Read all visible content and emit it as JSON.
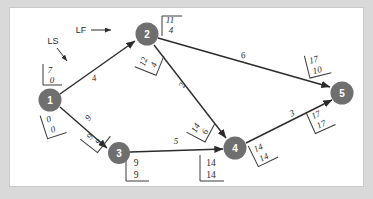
{
  "diagram": {
    "type": "project-network-cpm",
    "nodes": [
      {
        "id": "1",
        "label": "1",
        "x": 40,
        "y": 92
      },
      {
        "id": "2",
        "label": "2",
        "x": 137,
        "y": 26
      },
      {
        "id": "3",
        "label": "3",
        "x": 109,
        "y": 145
      },
      {
        "id": "4",
        "label": "4",
        "x": 225,
        "y": 140
      },
      {
        "id": "5",
        "label": "5",
        "x": 332,
        "y": 85
      }
    ],
    "edges": [
      {
        "from": "1",
        "to": "2",
        "duration": "4"
      },
      {
        "from": "1",
        "to": "3",
        "duration": "9"
      },
      {
        "from": "2",
        "to": "5",
        "duration": "6"
      },
      {
        "from": "2",
        "to": "4",
        "duration": "2"
      },
      {
        "from": "3",
        "to": "4",
        "duration": "5"
      },
      {
        "from": "4",
        "to": "5",
        "duration": "3"
      }
    ],
    "brackets": [
      {
        "name": "node1-start-ls-lf",
        "top": "7",
        "bottom": "0"
      },
      {
        "name": "node1-start-es-ef",
        "top": "0",
        "bottom": "0"
      },
      {
        "name": "node2-activity-1-2",
        "top": "11",
        "bottom": "4"
      },
      {
        "name": "node2-activity-2-4",
        "top": "12",
        "bottom": "4"
      },
      {
        "name": "node3-activity-1-3",
        "top": "9",
        "bottom": "9"
      },
      {
        "name": "node3-bottom",
        "top": "9",
        "bottom": "9"
      },
      {
        "name": "node4-activity-2-4-end",
        "top": "14",
        "bottom": "6"
      },
      {
        "name": "node4-bottom",
        "top": "14",
        "bottom": "14"
      },
      {
        "name": "node4-activity-4-5",
        "top": "14",
        "bottom": "14"
      },
      {
        "name": "node5-activity-2-5",
        "top": "17",
        "bottom": "10"
      },
      {
        "name": "node5-activity-4-5",
        "top": "17",
        "bottom": "17"
      }
    ],
    "annotations": [
      {
        "name": "ls-annotation",
        "text": "LS"
      },
      {
        "name": "lf-annotation",
        "text": "LF"
      }
    ],
    "colors": {
      "node_fill": "#6f6f6f",
      "node_text": "#ffffff",
      "edge": "#2b2b2b",
      "canvas": "#ffffff",
      "page_background": "#d9d9d9"
    }
  }
}
